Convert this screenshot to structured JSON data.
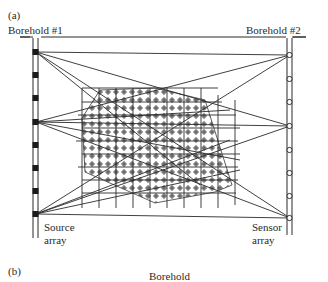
{
  "figure": {
    "panel_a_label": "(a)",
    "panel_b_label": "(b)",
    "borehole_1_label": "Borehold #1",
    "borehole_2_label": "Borehold #2",
    "source_label_line1": "Source",
    "source_label_line2": "array",
    "sensor_label_line1": "Sensor",
    "sensor_label_line2": "array",
    "panel_b_partial_label": "Borehold"
  },
  "diagram": {
    "type": "crosshole tomography ray diagram",
    "source_positions_y": [
      52,
      75,
      98,
      122,
      145,
      168,
      191,
      214
    ],
    "active_sources_y": [
      52,
      122,
      214
    ],
    "sensor_positions_y": [
      55,
      79,
      102,
      126,
      150,
      173,
      196,
      218
    ],
    "active_sensors_y": [
      55,
      126,
      218
    ],
    "colors": {
      "line": "#2a2a2a",
      "hatch": "#7a7a7a",
      "background": "#ffffff"
    }
  }
}
